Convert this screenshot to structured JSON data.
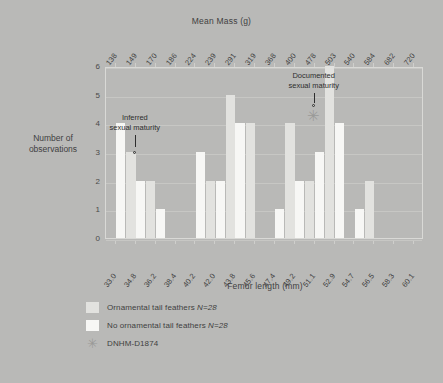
{
  "chart_data": {
    "type": "bar",
    "title": "",
    "xlabel": "Femur length (mm)",
    "xlabel_top": "Mean Mass (g)",
    "ylabel_line1": "Number of",
    "ylabel_line2": "observations",
    "ylim": [
      0,
      6
    ],
    "yticks": [
      "6",
      "5",
      "4",
      "3",
      "2",
      "1",
      "0"
    ],
    "grid": true,
    "legend_position": "below-left",
    "categories": [
      "33.0",
      "34.8",
      "36.2",
      "38.4",
      "40.2",
      "42.0",
      "43.8",
      "45.6",
      "47.4",
      "49.2",
      "51.1",
      "52.9",
      "54.7",
      "56.5",
      "58.3",
      "60.1"
    ],
    "top_categories": [
      "138",
      "149",
      "170",
      "186",
      "224",
      "239",
      "291",
      "319",
      "368",
      "400",
      "478",
      "503",
      "540",
      "584",
      "682",
      "720"
    ],
    "series": [
      {
        "name": "Ornamental tail feathers N=28",
        "color": "#e2e2df",
        "values": [
          0,
          3,
          2,
          0,
          0,
          2,
          5,
          4,
          0,
          4,
          2,
          6,
          0,
          2,
          0,
          0
        ]
      },
      {
        "name": "No ornamental tail feathers N=28",
        "color": "#f7f7f5",
        "values": [
          4,
          2,
          1,
          0,
          3,
          2,
          4,
          0,
          1,
          2,
          3,
          4,
          1,
          0,
          0,
          0
        ]
      }
    ],
    "annotations": [
      {
        "id": "inferred-sexual-maturity",
        "label_line1": "Inferred",
        "label_line2": "sexual maturity",
        "marker": "dot",
        "points_to_category": "34.8",
        "points_to_value": 3
      },
      {
        "id": "documented-sexual-maturity",
        "label_line1": "Documented",
        "label_line2": "sexual maturity",
        "marker": "asterisk",
        "points_to_category": "51.1",
        "points_to_value": 4
      }
    ]
  },
  "legend": {
    "items": [
      {
        "swatch": "ornamental-swatch",
        "text": "Ornamental tail feathers N=28"
      },
      {
        "swatch": "no-ornamental-swatch",
        "text": "No ornamental tail feathers N=28"
      },
      {
        "swatch": "asterisk-marker",
        "text": "DNHM-D1874"
      }
    ]
  },
  "colors": {
    "background": "#b9b9b7",
    "plot_border": "#d9d9d6",
    "gridline": "#c7c7c4",
    "bar_ornamental": "#e2e2df",
    "bar_no_ornamental": "#f7f7f5",
    "annotation_text": "#2e2e2e",
    "marker": "#9a9a98"
  },
  "glyphs": {
    "asterisk": "✳"
  }
}
